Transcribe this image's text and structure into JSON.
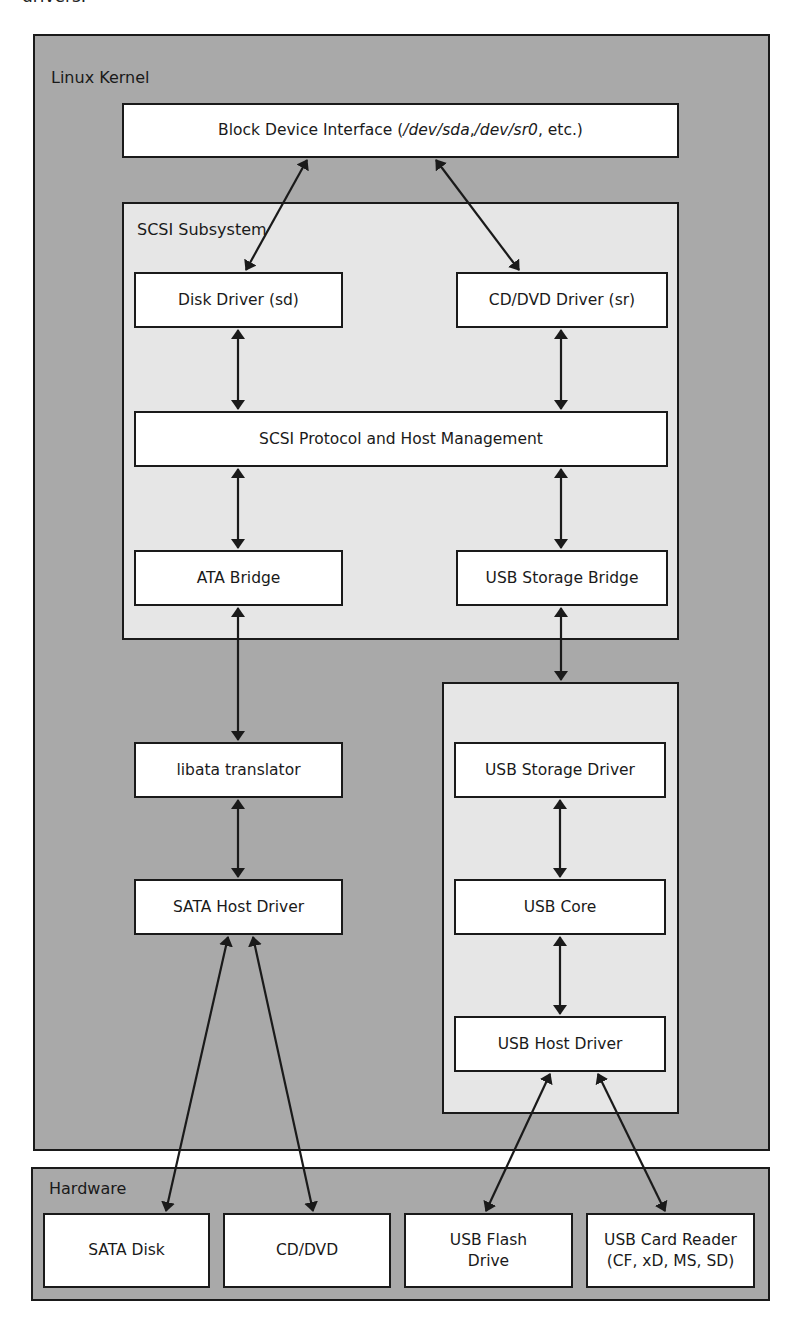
{
  "top_text": "drivers.",
  "regions": {
    "kernel": {
      "label": "Linux Kernel"
    },
    "scsi": {
      "label": "SCSI Subsystem"
    },
    "usb": {
      "label": ""
    },
    "hardware": {
      "label": "Hardware"
    }
  },
  "nodes": {
    "block_device": {
      "prefix": "Block Device Interface (",
      "dev_sda": "/dev/sda",
      "sep": ", ",
      "dev_sr0": "/dev/sr0",
      "suffix": ", etc.)"
    },
    "disk_driver": "Disk Driver (sd)",
    "cddvd_driver": "CD/DVD Driver (sr)",
    "scsi_protocol": "SCSI Protocol and Host Management",
    "ata_bridge": "ATA Bridge",
    "usb_storage_bridge": "USB Storage Bridge",
    "libata": "libata translator",
    "sata_host": "SATA Host Driver",
    "usb_storage_driver": "USB Storage Driver",
    "usb_core": "USB Core",
    "usb_host": "USB Host Driver",
    "sata_disk": "SATA Disk",
    "cddvd": "CD/DVD",
    "usb_flash": "USB Flash\nDrive",
    "usb_card_reader": "USB Card Reader\n(CF, xD, MS, SD)"
  },
  "colors": {
    "kernel_bg": "#a9a9a9",
    "subsystem_bg": "#e6e6e6",
    "node_bg": "#ffffff",
    "stroke": "#1a1a1a"
  }
}
